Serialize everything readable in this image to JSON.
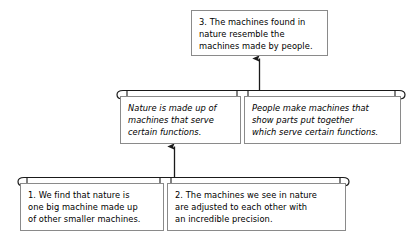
{
  "diagram": {
    "type": "argument-map",
    "title_text": "",
    "colors": {
      "background": "#ffffff",
      "box_border": "#8a8a8a",
      "connector": "#1a1a1a",
      "text": "#000000"
    },
    "nodes": [
      {
        "id": "conclusion",
        "number": "3.",
        "text": "3. The machines found in\nnature resemble the\nmachines made by people.",
        "style": "normal",
        "level": "conclusion"
      },
      {
        "id": "premise-nature",
        "number": "",
        "text": "Nature is made up of\nmachines that serve\ncertain functions.",
        "style": "italic",
        "level": "intermediate"
      },
      {
        "id": "premise-people",
        "number": "",
        "text": "People make machines that\nshow parts put together\nwhich serve certain functions.",
        "style": "italic",
        "level": "intermediate"
      },
      {
        "id": "evidence-one",
        "number": "1.",
        "text": "1. We find that nature is\none big machine made up\nof other smaller machines.",
        "style": "normal",
        "level": "premise"
      },
      {
        "id": "evidence-two",
        "number": "2.",
        "text": "2. The machines we see in nature\nare adjusted to each other with\nan incredible precision.",
        "style": "normal",
        "level": "premise"
      }
    ],
    "connectors": [
      {
        "id": "group-bar-intermediate",
        "kind": "co-premise-bracket",
        "joins": [
          "premise-nature",
          "premise-people"
        ]
      },
      {
        "id": "group-bar-premises",
        "kind": "co-premise-bracket",
        "joins": [
          "evidence-one",
          "evidence-two"
        ]
      },
      {
        "id": "arrow-intermediate-to-conclusion",
        "kind": "arrow-up",
        "from": "group-bar-intermediate",
        "to": "conclusion"
      },
      {
        "id": "arrow-premises-to-intermediate",
        "kind": "arrow-up",
        "from": "group-bar-premises",
        "to": "premise-nature"
      }
    ]
  }
}
